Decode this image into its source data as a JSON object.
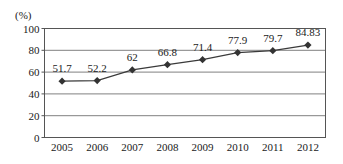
{
  "chart_data": {
    "type": "line",
    "title": "",
    "subtitle": "",
    "xlabel": "",
    "ylabel": "",
    "unit_label": "(%)",
    "categories": [
      "2005",
      "2006",
      "2007",
      "2008",
      "2009",
      "2010",
      "2011",
      "2012"
    ],
    "series": [
      {
        "name": "",
        "values": [
          51.7,
          52.2,
          62,
          66.8,
          71.4,
          77.9,
          79.7,
          84.83
        ],
        "point_labels": [
          "51.7",
          "52.2",
          "62",
          "66.8",
          "71.4",
          "77.9",
          "79.7",
          "84.83"
        ],
        "line_color": "#3a3a3a",
        "marker": "diamond",
        "marker_color": "#333333"
      }
    ],
    "ylim": [
      0,
      100
    ],
    "yticks": [
      0,
      20,
      40,
      60,
      80,
      100
    ],
    "ytick_labels": [
      "0",
      "20",
      "40",
      "60",
      "80",
      "100"
    ],
    "grid": true,
    "grid_axis": "y",
    "grid_color": "#808080",
    "legend": false,
    "legend_position": "none",
    "plot_border": true,
    "plot_border_color": "#555555",
    "background_color": "#ffffff"
  }
}
